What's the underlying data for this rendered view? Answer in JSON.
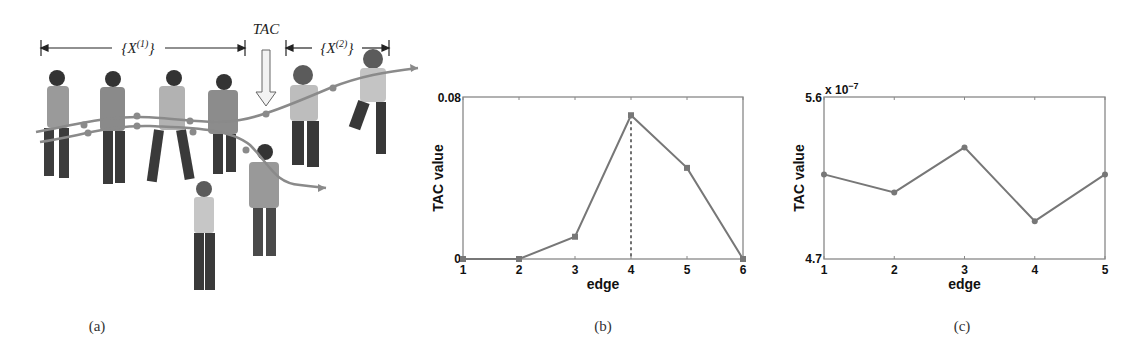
{
  "panel_a": {
    "caption": "(a)",
    "tac_label": "TAC",
    "set1_label": "{X",
    "set1_sup": "(1)",
    "set2_label": "{X",
    "set2_sup": "(2)",
    "close_brace": "}",
    "description": "Sequence of pedestrian silhouettes with two trajectory curves; TAC arrow marks boundary between segment X(1) and X(2)"
  },
  "panel_b": {
    "caption": "(b)"
  },
  "panel_c": {
    "caption": "(c)"
  },
  "chart_data": [
    {
      "type": "line",
      "panel": "(b)",
      "title": "",
      "xlabel": "edge",
      "ylabel": "TAC value",
      "x": [
        1,
        2,
        3,
        4,
        5,
        6
      ],
      "series": [
        {
          "name": "TAC value",
          "values": [
            0,
            0,
            0.011,
            0.071,
            0.045,
            0
          ],
          "marker": "square"
        }
      ],
      "xlim": [
        1,
        6
      ],
      "ylim": [
        0,
        0.08
      ],
      "xticks": [
        "1",
        "2",
        "3",
        "4",
        "5",
        "6"
      ],
      "yticks": [
        "0",
        "0.08"
      ],
      "annotations": [
        {
          "type": "dashed-vertical-line",
          "x": 4,
          "note": "maximum TAC at edge 4"
        }
      ],
      "grid": false,
      "line_color": "#777777"
    },
    {
      "type": "line",
      "panel": "(c)",
      "title": "",
      "xlabel": "edge",
      "ylabel": "TAC value",
      "y_scale_label": "x 10^-7",
      "x": [
        1,
        2,
        3,
        4,
        5
      ],
      "series": [
        {
          "name": "TAC value",
          "values": [
            5.17e-07,
            5.07e-07,
            5.32e-07,
            4.91e-07,
            5.17e-07
          ],
          "marker": "dot"
        }
      ],
      "xlim": [
        1,
        5
      ],
      "ylim": [
        4.7e-07,
        5.6e-07
      ],
      "xticks": [
        "1",
        "2",
        "3",
        "4",
        "5"
      ],
      "yticks": [
        "4.7",
        "5.6"
      ],
      "grid": false,
      "line_color": "#777777"
    }
  ]
}
